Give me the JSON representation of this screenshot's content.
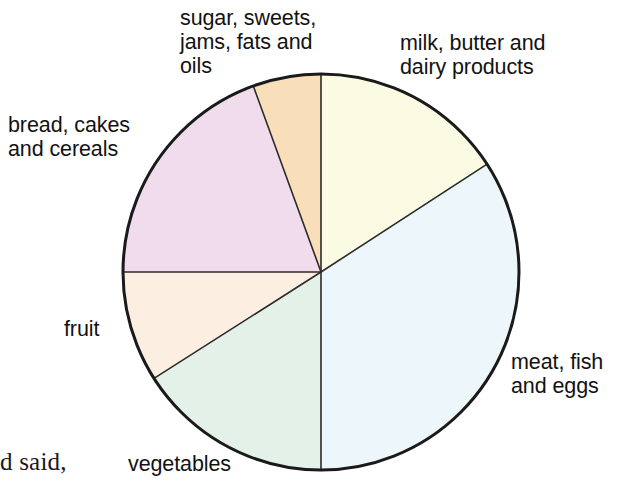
{
  "page": {
    "margin_text": "d said,"
  },
  "chart_data": {
    "type": "pie",
    "title": "",
    "subtitle": "",
    "xlabel": "",
    "ylabel": "",
    "legend_position": "outside-callout-labels",
    "grid": false,
    "center": {
      "cx": 321,
      "cy": 272
    },
    "radius": 198,
    "start_angle_deg": 0,
    "direction": "clockwise",
    "outline_color": "#1a1a1a",
    "outline_width": 3,
    "divider_color": "#2b2b2b",
    "divider_width": 1.6,
    "categories": [
      "milk, butter and dairy products",
      "meat, fish and eggs",
      "vegetables",
      "fruit",
      "bread, cakes and cereals",
      "sugar, sweets, jams, fats and oils"
    ],
    "values": [
      57,
      123,
      57.5,
      32.5,
      70,
      20
    ],
    "value_unit": "degrees",
    "percentages": [
      15.8,
      34.2,
      16.0,
      9.0,
      19.4,
      5.6
    ],
    "slices": [
      {
        "label": "milk, butter and dairy products",
        "label_lines": "milk, butter and\ndairy products",
        "start_deg": 0,
        "end_deg": 57,
        "sweep_deg": 57,
        "percent": 15.8,
        "color": "#fbfae2",
        "name": "milk-butter-dairy"
      },
      {
        "label": "meat, fish and eggs",
        "label_lines": "meat, fish\nand eggs",
        "start_deg": 57,
        "end_deg": 180,
        "sweep_deg": 123,
        "percent": 34.2,
        "color": "#ecf6fb",
        "name": "meat-fish-eggs"
      },
      {
        "label": "vegetables",
        "label_lines": "vegetables",
        "start_deg": 180,
        "end_deg": 237.5,
        "sweep_deg": 57.5,
        "percent": 16.0,
        "color": "#e4f1e9",
        "name": "vegetables"
      },
      {
        "label": "fruit",
        "label_lines": "fruit",
        "start_deg": 237.5,
        "end_deg": 270,
        "sweep_deg": 32.5,
        "percent": 9.0,
        "color": "#fceee0",
        "name": "fruit"
      },
      {
        "label": "bread, cakes and cereals",
        "label_lines": "bread, cakes\nand cereals",
        "start_deg": 270,
        "end_deg": 340,
        "sweep_deg": 70,
        "percent": 19.4,
        "color": "#f1dcee",
        "name": "bread-cakes-cereals"
      },
      {
        "label": "sugar, sweets, jams, fats and oils",
        "label_lines": "sugar, sweets,\njams, fats and\noils",
        "start_deg": 340,
        "end_deg": 360,
        "sweep_deg": 20,
        "percent": 5.6,
        "color": "#f8dfba",
        "name": "sugar-sweets-jams-fats-oils"
      }
    ]
  }
}
